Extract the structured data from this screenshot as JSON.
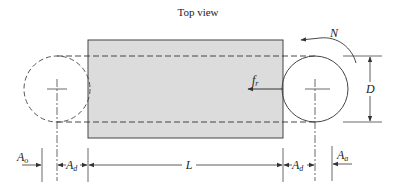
{
  "title": "Top view",
  "labels": {
    "rotation": "N",
    "force": "f",
    "force_sub": "r",
    "diameter": "D",
    "length": "L",
    "approach_left": "A",
    "approach_left_sub": "o",
    "approach_right": "A",
    "approach_right_sub": "a",
    "offset_left": "A",
    "offset_left_sub": "d",
    "offset_right": "A",
    "offset_right_sub": "d"
  },
  "colors": {
    "workpiece_fill": "#dcdcdc",
    "line": "#333333"
  }
}
